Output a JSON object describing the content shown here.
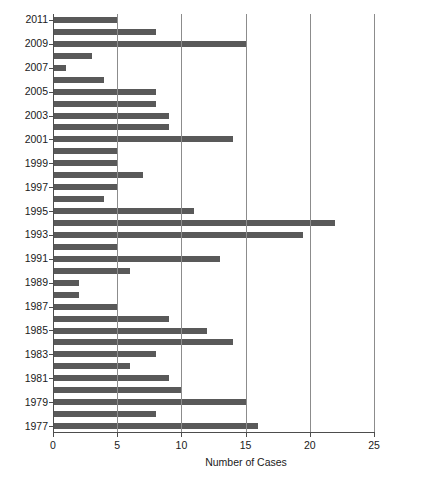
{
  "chart_data": {
    "type": "bar",
    "orientation": "horizontal",
    "title": "",
    "xlabel": "Number of Cases",
    "ylabel": "",
    "xlim": [
      0,
      25
    ],
    "ylim_categories": "1977-2011",
    "grid": true,
    "grid_axis": "x",
    "legend": "none",
    "bar_color": "#595959",
    "axis_color": "#4d4d4d",
    "gridline_color": "#8c8c8c",
    "background": "#ffffff",
    "x_ticks": [
      0,
      5,
      10,
      15,
      20,
      25
    ],
    "x_tick_labels": [
      "0",
      "5",
      "10",
      "15",
      "20",
      "25"
    ],
    "y_tick_labels": [
      "2011",
      "2009",
      "2007",
      "2005",
      "2003",
      "2001",
      "1999",
      "1997",
      "1995",
      "1993",
      "1991",
      "1989",
      "1987",
      "1985",
      "1983",
      "1981",
      "1979",
      "1977"
    ],
    "categories": [
      "1977",
      "1978",
      "1979",
      "1980",
      "1981",
      "1982",
      "1983",
      "1984",
      "1985",
      "1986",
      "1987",
      "1988",
      "1989",
      "1990",
      "1991",
      "1992",
      "1993",
      "1994",
      "1995",
      "1996",
      "1997",
      "1998",
      "1999",
      "2000",
      "2001",
      "2002",
      "2003",
      "2004",
      "2005",
      "2006",
      "2007",
      "2008",
      "2009",
      "2010",
      "2011"
    ],
    "values": [
      16,
      8,
      15,
      10,
      9,
      6,
      8,
      14,
      12,
      9,
      5,
      2,
      2,
      6,
      13,
      5,
      19.5,
      22,
      11,
      4,
      5,
      7,
      5,
      5,
      14,
      9,
      9,
      8,
      8,
      4,
      1,
      3,
      15,
      8,
      5
    ]
  }
}
